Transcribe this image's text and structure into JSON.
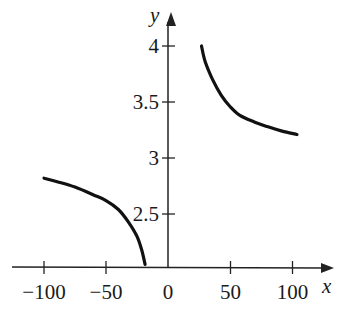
{
  "chart_data": {
    "type": "line",
    "title": "",
    "xlabel": "x",
    "ylabel": "y",
    "x_ticks": [
      -100,
      -50,
      0,
      50,
      100
    ],
    "x_tick_labels": [
      "−100",
      "−50",
      "0",
      "50",
      "100"
    ],
    "y_ticks": [
      2.5,
      3,
      3.5,
      4
    ],
    "y_tick_labels": [
      "2.5",
      "3",
      "3.5",
      "4"
    ],
    "xlim": [
      -125,
      135
    ],
    "ylim": [
      2.03,
      4.3
    ],
    "grid": false,
    "legend": null,
    "series": [
      {
        "name": "left branch",
        "x": [
          -100,
          -90,
          -75,
          -60,
          -50,
          -40,
          -32,
          -25,
          -21,
          -18.5
        ],
        "y": [
          2.82,
          2.79,
          2.74,
          2.67,
          2.62,
          2.54,
          2.43,
          2.3,
          2.17,
          2.05
        ]
      },
      {
        "name": "right branch",
        "x": [
          27,
          30,
          36,
          43,
          50,
          58,
          70,
          80,
          92,
          104
        ],
        "y": [
          4.0,
          3.86,
          3.7,
          3.56,
          3.46,
          3.38,
          3.32,
          3.28,
          3.24,
          3.21
        ]
      }
    ]
  },
  "colors": {
    "curve": "#111111",
    "axis": "#222222",
    "background": "#ffffff"
  }
}
